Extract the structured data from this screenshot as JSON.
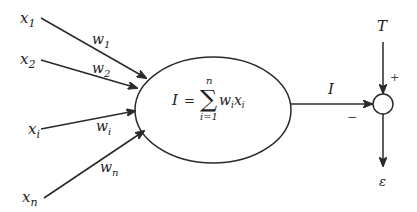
{
  "diagram": {
    "inputs": [
      {
        "name": "x",
        "sub": "1",
        "weight": "w",
        "weight_sub": "1"
      },
      {
        "name": "x",
        "sub": "2",
        "weight": "w",
        "weight_sub": "2"
      },
      {
        "name": "x",
        "sub": "i",
        "weight": "w",
        "weight_sub": "i"
      },
      {
        "name": "x",
        "sub": "n",
        "weight": "w",
        "weight_sub": "n"
      }
    ],
    "neuron": {
      "lhs": "I",
      "equals": "=",
      "sum_symbol": "∑",
      "upper_limit": "n",
      "lower_limit": "i=1",
      "term_w": "w",
      "term_w_sub": "i",
      "term_x": "x",
      "term_x_sub": "i"
    },
    "output_label": "I",
    "target_label": "T",
    "plus_sign": "+",
    "minus_sign": "−",
    "error_label": "ε",
    "colors": {
      "stroke": "#2a2a2a",
      "text": "#222222",
      "background": "#ffffff"
    }
  }
}
